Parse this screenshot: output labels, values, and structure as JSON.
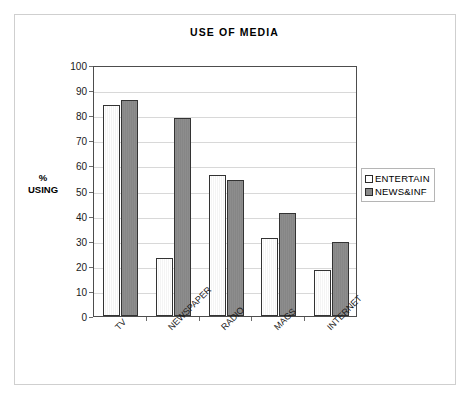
{
  "chart_data": {
    "type": "bar",
    "title": "USE OF MEDIA",
    "xlabel": "",
    "ylabel": "% USING",
    "ylabel_lines": [
      "%",
      "USING"
    ],
    "ylim": [
      0,
      100
    ],
    "ytick_step": 10,
    "yticks": [
      0,
      10,
      20,
      30,
      40,
      50,
      60,
      70,
      80,
      90,
      100
    ],
    "ytick_labels": [
      "0",
      "10",
      "20",
      "30",
      "40",
      "50",
      "60",
      "70",
      "80",
      "90",
      "100"
    ],
    "grid": true,
    "grid_axis": "y",
    "legend_position": "right",
    "categories": [
      "TV",
      "NEWSPAPER",
      "RADIO",
      "MAGS",
      "INTERNET"
    ],
    "series": [
      {
        "name": "ENTERTAIN",
        "color": "#ffffff",
        "edge_color": "#333333",
        "values": [
          84,
          23,
          56,
          31,
          18.5
        ]
      },
      {
        "name": "NEWS&INF",
        "color": "#8a8a8a",
        "edge_color": "#333333",
        "values": [
          86,
          79,
          54,
          41,
          29.5
        ]
      }
    ]
  },
  "legend": {
    "items": [
      {
        "label": "ENTERTAIN",
        "swatch": "legend-swatch-entertain"
      },
      {
        "label": "NEWS&INF",
        "swatch": "legend-swatch-newsinf"
      }
    ]
  },
  "colors": {
    "entertain_fill": "#ffffff",
    "newsinf_fill": "#8a8a8a",
    "bar_edge": "#333333",
    "gridline": "#d8d8d8",
    "plot_border": "#4d4d4d",
    "page_border": "#cfcfcf",
    "text": "#000000",
    "background": "#ffffff"
  }
}
